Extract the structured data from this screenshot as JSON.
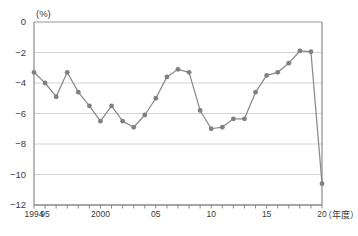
{
  "chart_data": {
    "type": "line",
    "title": "",
    "subtitle": "",
    "xlabel": "(年度)",
    "ylabel": "(%)",
    "ylim": [
      -12,
      0
    ],
    "xlim": [
      1994,
      2020
    ],
    "grid": true,
    "legend": null,
    "marker": "circle",
    "series_color": "#808080",
    "ytick_labels": [
      "0",
      "-2",
      "-4",
      "-6",
      "-8",
      "-10",
      "-12"
    ],
    "ytick_values": [
      0,
      -2,
      -4,
      -6,
      -8,
      -10,
      -12
    ],
    "xtick_values": [
      1994,
      1995,
      1996,
      1997,
      1998,
      1999,
      2000,
      2001,
      2002,
      2003,
      2004,
      2005,
      2006,
      2007,
      2008,
      2009,
      2010,
      2011,
      2012,
      2013,
      2014,
      2015,
      2016,
      2017,
      2018,
      2019,
      2020
    ],
    "xtick_labeled": [
      {
        "value": 1994,
        "label": "1994"
      },
      {
        "value": 1995,
        "label": "95"
      },
      {
        "value": 2000,
        "label": "2000"
      },
      {
        "value": 2005,
        "label": "05"
      },
      {
        "value": 2010,
        "label": "10"
      },
      {
        "value": 2015,
        "label": "15"
      },
      {
        "value": 2020,
        "label": "20"
      }
    ],
    "x": [
      1994,
      1995,
      1996,
      1997,
      1998,
      1999,
      2000,
      2001,
      2002,
      2003,
      2004,
      2005,
      2006,
      2007,
      2008,
      2009,
      2010,
      2011,
      2012,
      2013,
      2014,
      2015,
      2016,
      2017,
      2018,
      2019,
      2020
    ],
    "values": [
      -3.3,
      -4.0,
      -4.9,
      -3.3,
      -4.6,
      -5.5,
      -6.5,
      -5.5,
      -6.5,
      -6.9,
      -6.1,
      -5.0,
      -3.6,
      -3.1,
      -3.3,
      -5.8,
      -7.0,
      -6.9,
      -6.35,
      -6.35,
      -4.6,
      -3.5,
      -3.3,
      -2.7,
      -1.9,
      -1.95,
      -10.6
    ],
    "annotations": []
  },
  "axes": {
    "unit_top": "(%)",
    "unit_right": "（年度）"
  }
}
